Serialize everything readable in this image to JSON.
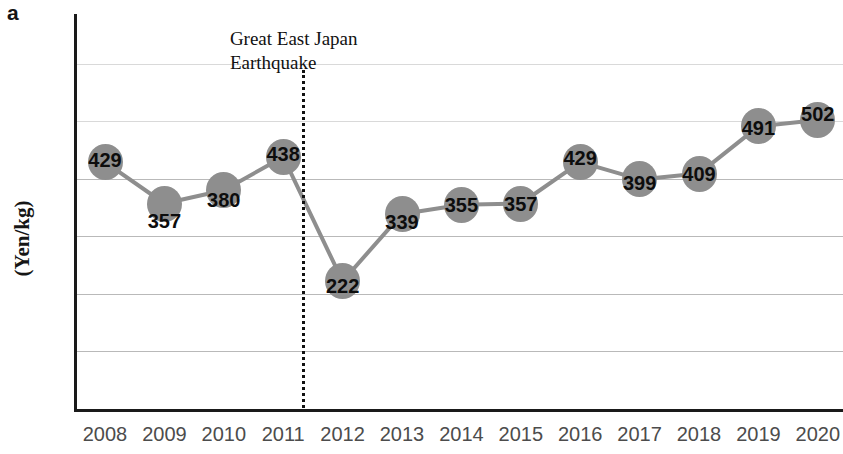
{
  "panel": {
    "letter": "a"
  },
  "axes": {
    "ylabel": "(Yen/kg)",
    "xlabel": ""
  },
  "annotation": {
    "text": "Great East Japan\nEarthquake",
    "at_x": 2011.5
  },
  "style": {
    "marker_color": "#8e8e8e",
    "line_color": "#8e8e8e",
    "grid_color": "#b9b9b9",
    "axis_color": "#1a1a1a",
    "label_color": "#0d0d0d",
    "tick_color": "#4c4c4c"
  },
  "chart_data": {
    "type": "line",
    "title": "",
    "xlabel": "",
    "ylabel": "(Yen/kg)",
    "categories": [
      "2008",
      "2009",
      "2010",
      "2011",
      "2012",
      "2013",
      "2014",
      "2015",
      "2016",
      "2017",
      "2018",
      "2019",
      "2020"
    ],
    "values": [
      429,
      357,
      380,
      438,
      222,
      339,
      355,
      357,
      429,
      399,
      409,
      491,
      502
    ],
    "data_labels": [
      "429",
      "357",
      "380",
      "438",
      "222",
      "339",
      "355",
      "357",
      "429",
      "399",
      "409",
      "491",
      "502"
    ],
    "ylim": [
      0,
      690
    ],
    "gridlines": [
      100,
      200,
      300,
      400,
      500,
      600
    ],
    "grid": true,
    "legend": "none",
    "annotations": [
      {
        "text": "Great East Japan Earthquake",
        "type": "vertical-dotted-line",
        "x": 2011.5
      }
    ],
    "marker": "circle-with-value-label",
    "label_offsets": [
      {
        "dx": -18,
        "dy": -2
      },
      {
        "dx": -18,
        "dy": 17
      },
      {
        "dx": -18,
        "dy": 10
      },
      {
        "dx": -18,
        "dy": -3
      },
      {
        "dx": -18,
        "dy": 5
      },
      {
        "dx": -18,
        "dy": 8
      },
      {
        "dx": -18,
        "dy": 0
      },
      {
        "dx": -18,
        "dy": 0
      },
      {
        "dx": -18,
        "dy": -4
      },
      {
        "dx": -18,
        "dy": 4
      },
      {
        "dx": -18,
        "dy": 0
      },
      {
        "dx": -18,
        "dy": 2
      },
      {
        "dx": -18,
        "dy": -6
      }
    ]
  }
}
